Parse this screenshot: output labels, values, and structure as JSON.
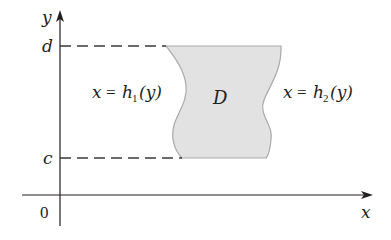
{
  "diagram": {
    "type": "type-II-region",
    "colors": {
      "axis": "#231f20",
      "region_fill": "#e2e2e2",
      "region_stroke": "#a9a9a9",
      "dashed": "#3a3a3a",
      "text": "#231f20"
    },
    "axes": {
      "x_label": "x",
      "y_label": "y",
      "origin_label": "0"
    },
    "ticks": {
      "d_label": "d",
      "c_label": "c"
    },
    "region": {
      "label": "D"
    },
    "curves": {
      "left": {
        "lhs": "x",
        "eq": "=",
        "func": "h",
        "sub": "1",
        "arg": "(y)"
      },
      "right": {
        "lhs": "x",
        "eq": "=",
        "func": "h",
        "sub": "2",
        "arg": "(y)"
      }
    }
  }
}
